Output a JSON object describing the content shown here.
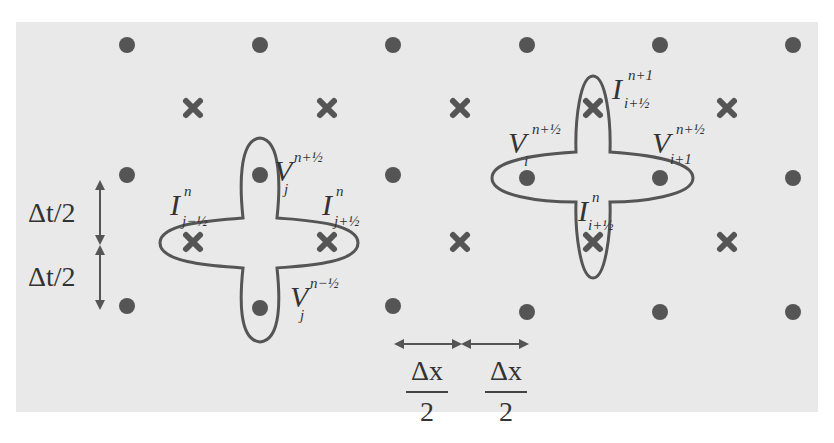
{
  "diagram": {
    "colors": {
      "background": "#ffffff",
      "panel": "#e9e9e9",
      "marker": "#555555",
      "stencil_outline": "#555555",
      "text": "#333333"
    },
    "grid": {
      "dot_columns_x": [
        127,
        260,
        393,
        527,
        660,
        793
      ],
      "dot_rows_y": [
        45,
        205,
        307
      ],
      "cross_columns_x": [
        193,
        327,
        460,
        593,
        727
      ],
      "cross_rows_y": [
        108,
        242
      ]
    },
    "left_stencil": {
      "labels": {
        "v_top": {
          "base": "V",
          "sup": "n+½",
          "sub": "j"
        },
        "i_left": {
          "base": "I",
          "sup": "n",
          "sub": "j−½"
        },
        "i_right": {
          "base": "I",
          "sup": "n",
          "sub": "j+½"
        },
        "v_bottom": {
          "base": "V",
          "sup": "n−½",
          "sub": "j"
        }
      }
    },
    "right_stencil": {
      "labels": {
        "i_top": {
          "base": "I",
          "sup": "n+1",
          "sub": "i+½"
        },
        "v_left": {
          "base": "V",
          "sup": "n+½",
          "sub": "i"
        },
        "v_right": {
          "base": "V",
          "sup": "n+½",
          "sub": "i+1"
        },
        "i_bottom": {
          "base": "I",
          "sup": "n",
          "sub": "i+½"
        }
      }
    },
    "time_step": {
      "upper": "Δt/2",
      "lower": "Δt/2"
    },
    "space_step": {
      "left": {
        "num": "Δx",
        "den": "2"
      },
      "right": {
        "num": "Δx",
        "den": "2"
      }
    }
  }
}
